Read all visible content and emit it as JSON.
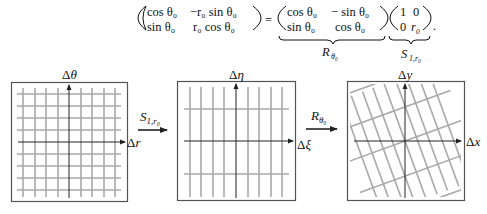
{
  "equation": {
    "lhs": {
      "r1c1": "cos θ₀",
      "r1c2": "−r₀ sin θ₀",
      "r2c1": "sin θ₀",
      "r2c2": "r₀ cos θ₀"
    },
    "equals": "=",
    "rotation": {
      "r1c1": "cos θ₀",
      "r1c2": "− sin θ₀",
      "r2c1": "sin θ₀",
      "r2c2": "cos θ₀",
      "underbrace_label": "R",
      "underbrace_sub": "θ₀"
    },
    "scale": {
      "r1c1": "1",
      "r1c2": "0",
      "r2c1": "0",
      "r2c2": "r₀",
      "underbrace_label": "S",
      "underbrace_sub": "1,r₀"
    },
    "period": "."
  },
  "panels": [
    {
      "name": "polar-grid",
      "x_axis_label": "Δr",
      "y_axis_label": "Δθ",
      "x_axis_prefix": "Δ",
      "x_axis_var": "r",
      "y_axis_var": "θ"
    },
    {
      "name": "scaled-grid",
      "x_axis_label": "Δξ",
      "y_axis_label": "Δη",
      "x_axis_var": "ξ",
      "y_axis_var": "η"
    },
    {
      "name": "rotated-grid",
      "x_axis_label": "Δx",
      "y_axis_label": "Δy",
      "x_axis_var": "x",
      "y_axis_var": "y"
    }
  ],
  "arrows": [
    {
      "label": "S",
      "sub": "1,r₀"
    },
    {
      "label": "R",
      "sub": "θ₀"
    }
  ],
  "colors": {
    "grid": "#a9a9a9",
    "axis": "#222222",
    "frame": "#555555"
  }
}
